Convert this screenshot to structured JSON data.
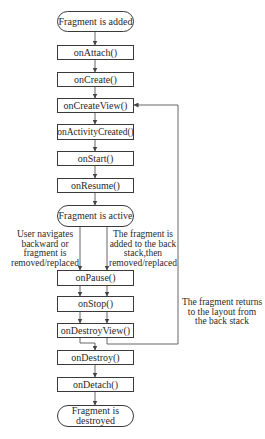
{
  "diagram": {
    "nodes": [
      {
        "id": "added",
        "label": "Fragment is added",
        "shape": "rounded"
      },
      {
        "id": "onAttach",
        "label": "onAttach()",
        "shape": "rect"
      },
      {
        "id": "onCreate",
        "label": "onCreate()",
        "shape": "rect"
      },
      {
        "id": "onCreateView",
        "label": "onCreateView()",
        "shape": "rect"
      },
      {
        "id": "onActivityCreated",
        "label": "onActivityCreated()",
        "shape": "rect"
      },
      {
        "id": "onStart",
        "label": "onStart()",
        "shape": "rect"
      },
      {
        "id": "onResume",
        "label": "onResume()",
        "shape": "rect"
      },
      {
        "id": "active",
        "label": "Fragment is active",
        "shape": "rounded"
      },
      {
        "id": "onPause",
        "label": "onPause()",
        "shape": "rect"
      },
      {
        "id": "onStop",
        "label": "onStop()",
        "shape": "rect"
      },
      {
        "id": "onDestroyView",
        "label": "onDestroyView()",
        "shape": "rect"
      },
      {
        "id": "onDestroy",
        "label": "onDestroy()",
        "shape": "rect"
      },
      {
        "id": "onDetach",
        "label": "onDetach()",
        "shape": "rect"
      },
      {
        "id": "destroyed",
        "label_line1": "Fragment is",
        "label_line2": "destroyed",
        "shape": "rounded"
      }
    ],
    "notes": {
      "left": [
        "User navigates",
        "backward or",
        "fragment is",
        "removed/replaced"
      ],
      "right": [
        "The fragment is",
        "added to the back",
        "stack,then",
        "removed/replaced"
      ],
      "loop": [
        "The fragment returns",
        "to the layout from",
        "the back stack"
      ]
    },
    "edges": [
      {
        "from": "added",
        "to": "onAttach"
      },
      {
        "from": "onAttach",
        "to": "onCreate"
      },
      {
        "from": "onCreate",
        "to": "onCreateView"
      },
      {
        "from": "onCreateView",
        "to": "onActivityCreated"
      },
      {
        "from": "onActivityCreated",
        "to": "onStart"
      },
      {
        "from": "onStart",
        "to": "onResume"
      },
      {
        "from": "onResume",
        "to": "active"
      },
      {
        "from": "active",
        "to": "onPause",
        "label": "User navigates backward or fragment is removed/replaced"
      },
      {
        "from": "active",
        "to": "onPause",
        "label": "The fragment is added to the back stack,then removed/replaced"
      },
      {
        "from": "onPause",
        "to": "onStop"
      },
      {
        "from": "onStop",
        "to": "onDestroyView"
      },
      {
        "from": "onDestroyView",
        "to": "onDestroy"
      },
      {
        "from": "onDestroyView",
        "to": "onCreateView",
        "label": "The fragment returns to the layout from the back stack"
      },
      {
        "from": "onDestroy",
        "to": "onDetach"
      },
      {
        "from": "onDetach",
        "to": "destroyed"
      }
    ]
  }
}
